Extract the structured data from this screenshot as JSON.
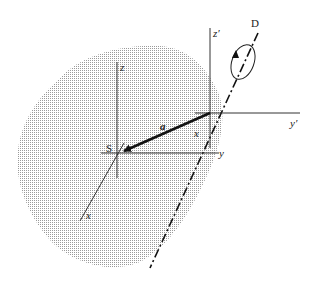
{
  "diagram": {
    "type": "rigid-body-rotation-axes",
    "labels": {
      "rotation_axis": "D",
      "body_frame_origin": "S",
      "displacement_vector": "a",
      "z_body": "z",
      "y_body": "y",
      "x_body": "x",
      "z_prime": "z′",
      "y_prime": "y′",
      "x_prime": "x"
    },
    "colors": {
      "body_fill": "#d9d9d9",
      "lines": "#222222",
      "background": "#ffffff"
    }
  }
}
